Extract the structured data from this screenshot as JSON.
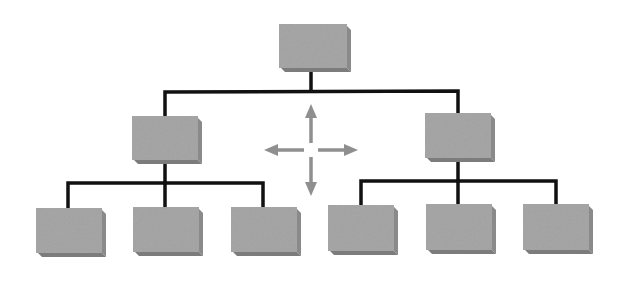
{
  "diagram": {
    "type": "hierarchy-org-chart",
    "colors": {
      "box_fill": "#a3a3a3",
      "box_side": "#8a8a8a",
      "box_bottom": "#7c7c7c",
      "connector": "#111111",
      "arrow": "#8f8f8f",
      "background": "#ffffff"
    },
    "nodes": [
      {
        "id": "root",
        "level": 0,
        "x": 279,
        "y": 24,
        "w": 68,
        "h": 44
      },
      {
        "id": "mid-left",
        "level": 1,
        "parent": "root",
        "x": 132,
        "y": 116,
        "w": 66,
        "h": 44
      },
      {
        "id": "mid-right",
        "level": 1,
        "parent": "root",
        "x": 425,
        "y": 113,
        "w": 66,
        "h": 45
      },
      {
        "id": "leaf-1",
        "level": 2,
        "parent": "mid-left",
        "x": 36,
        "y": 208,
        "w": 66,
        "h": 45
      },
      {
        "id": "leaf-2",
        "level": 2,
        "parent": "mid-left",
        "x": 133,
        "y": 207,
        "w": 66,
        "h": 45
      },
      {
        "id": "leaf-3",
        "level": 2,
        "parent": "mid-left",
        "x": 231,
        "y": 207,
        "w": 66,
        "h": 45
      },
      {
        "id": "leaf-4",
        "level": 2,
        "parent": "mid-right",
        "x": 328,
        "y": 205,
        "w": 66,
        "h": 46
      },
      {
        "id": "leaf-5",
        "level": 2,
        "parent": "mid-right",
        "x": 426,
        "y": 204,
        "w": 66,
        "h": 46
      },
      {
        "id": "leaf-6",
        "level": 2,
        "parent": "mid-right",
        "x": 523,
        "y": 204,
        "w": 66,
        "h": 46
      }
    ],
    "connectors": [
      {
        "id": "root-stem",
        "points": [
          [
            311,
            68
          ],
          [
            311,
            91
          ]
        ]
      },
      {
        "id": "level1-bar",
        "points": [
          [
            165,
            116
          ],
          [
            165,
            92
          ],
          [
            458,
            91
          ],
          [
            458,
            113
          ]
        ]
      },
      {
        "id": "mid-left-stem",
        "points": [
          [
            165,
            160
          ],
          [
            165,
            183
          ]
        ]
      },
      {
        "id": "left-bar",
        "points": [
          [
            68,
            208
          ],
          [
            68,
            183
          ],
          [
            263,
            183
          ],
          [
            263,
            207
          ]
        ]
      },
      {
        "id": "left-center-drop",
        "points": [
          [
            165,
            183
          ],
          [
            165,
            207
          ]
        ]
      },
      {
        "id": "mid-right-stem",
        "points": [
          [
            458,
            158
          ],
          [
            458,
            181
          ]
        ]
      },
      {
        "id": "right-bar",
        "points": [
          [
            361,
            205
          ],
          [
            361,
            181
          ],
          [
            556,
            181
          ],
          [
            556,
            204
          ]
        ]
      },
      {
        "id": "right-center-drop",
        "points": [
          [
            458,
            181
          ],
          [
            458,
            204
          ]
        ]
      }
    ],
    "move_arrows": {
      "center": [
        311,
        150
      ],
      "icon": "four-way-move-arrows",
      "directions": [
        "up",
        "down",
        "left",
        "right"
      ]
    }
  }
}
